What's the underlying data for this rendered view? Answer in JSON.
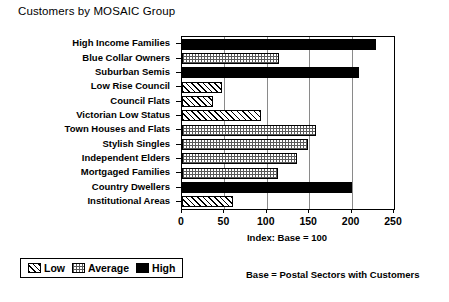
{
  "chart_data": {
    "type": "bar",
    "orientation": "horizontal",
    "title": "Customers by MOSAIC Group",
    "xlabel": "Index: Base = 100",
    "ylabel": "",
    "xlim": [
      0,
      250
    ],
    "xticks": [
      0,
      50,
      100,
      150,
      200,
      250
    ],
    "grid": true,
    "categories": [
      "High Income Families",
      "Blue Collar Owners",
      "Suburban Semis",
      "Low Rise Council",
      "Council Flats",
      "Victorian Low Status",
      "Town Houses and Flats",
      "Stylish Singles",
      "Independent Elders",
      "Mortgaged Families",
      "Country Dwellers",
      "Institutional Areas"
    ],
    "values": [
      229,
      114,
      209,
      47,
      37,
      93,
      158,
      148,
      136,
      113,
      200,
      60
    ],
    "bands": [
      "High",
      "Average",
      "High",
      "Low",
      "Low",
      "Low",
      "Average",
      "Average",
      "Average",
      "Average",
      "High",
      "Low"
    ],
    "legend": {
      "position": "bottom-left",
      "entries": [
        {
          "label": "Low",
          "pattern": "diagonal-hatch"
        },
        {
          "label": "Average",
          "pattern": "checkered"
        },
        {
          "label": "High",
          "pattern": "solid-black"
        }
      ]
    },
    "footnote": "Base  =  Postal Sectors with Customers"
  },
  "colors": {
    "axis": "#000000",
    "grid": "#8a8a8a",
    "high": "#000000",
    "average": "#9a9a9a",
    "low": "#ffffff",
    "background": "#ffffff"
  }
}
